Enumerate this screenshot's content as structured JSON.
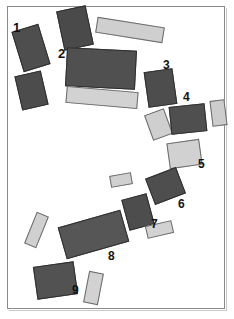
{
  "figure": {
    "title": "",
    "width": 234,
    "height": 319,
    "background": "#ffffff",
    "frame": {
      "name": "plot-border",
      "stroke": "#8a8a8a",
      "x": 7,
      "y": 6,
      "w": 218,
      "h": 303
    },
    "palette": {
      "dark": "#4b4b4b",
      "dark_alt": "#585858",
      "light": "#cccccc",
      "light_alt": "#d4d4d4",
      "outline_dark": "#2f2f2f",
      "outline_light": "#6b6b6b",
      "label_color": "#111111"
    }
  },
  "shapes": [
    {
      "id": "shape-a",
      "tone": "dark",
      "fill": "#4e4e4e",
      "x": 17,
      "y": 27,
      "w": 28,
      "h": 42,
      "rot": -17
    },
    {
      "id": "shape-b",
      "tone": "dark",
      "fill": "#4a4a4a",
      "x": 60,
      "y": 8,
      "w": 30,
      "h": 40,
      "rot": -12
    },
    {
      "id": "shape-c",
      "tone": "light",
      "fill": "#cfcfcf",
      "x": 96,
      "y": 22,
      "w": 68,
      "h": 16,
      "rot": 9
    },
    {
      "id": "shape-d",
      "tone": "dark",
      "fill": "#4c4c4c",
      "x": 18,
      "y": 73,
      "w": 27,
      "h": 35,
      "rot": -13
    },
    {
      "id": "shape-e",
      "tone": "dark",
      "fill": "#505050",
      "x": 66,
      "y": 49,
      "w": 70,
      "h": 39,
      "rot": 3
    },
    {
      "id": "shape-f",
      "tone": "light",
      "fill": "#d2d2d2",
      "x": 66,
      "y": 89,
      "w": 72,
      "h": 17,
      "rot": 5
    },
    {
      "id": "shape-g",
      "tone": "dark",
      "fill": "#4d4d4d",
      "x": 146,
      "y": 70,
      "w": 29,
      "h": 36,
      "rot": -8
    },
    {
      "id": "shape-h",
      "tone": "light",
      "fill": "#cfcfcf",
      "x": 148,
      "y": 111,
      "w": 21,
      "h": 27,
      "rot": -20
    },
    {
      "id": "shape-i",
      "tone": "dark",
      "fill": "#4f4f4f",
      "x": 170,
      "y": 105,
      "w": 36,
      "h": 28,
      "rot": -6
    },
    {
      "id": "shape-j",
      "tone": "light",
      "fill": "#cdcdcd",
      "x": 211,
      "y": 100,
      "w": 15,
      "h": 26,
      "rot": -7
    },
    {
      "id": "shape-k",
      "tone": "light",
      "fill": "#d1d1d1",
      "x": 168,
      "y": 141,
      "w": 33,
      "h": 26,
      "rot": -8
    },
    {
      "id": "shape-l",
      "tone": "light",
      "fill": "#d0d0d0",
      "x": 110,
      "y": 174,
      "w": 22,
      "h": 12,
      "rot": -10
    },
    {
      "id": "shape-m",
      "tone": "dark",
      "fill": "#4e4e4e",
      "x": 149,
      "y": 172,
      "w": 33,
      "h": 28,
      "rot": -21
    },
    {
      "id": "shape-n",
      "tone": "dark",
      "fill": "#4d4d4d",
      "x": 125,
      "y": 196,
      "w": 26,
      "h": 32,
      "rot": -15
    },
    {
      "id": "shape-o",
      "tone": "light",
      "fill": "#d2d2d2",
      "x": 146,
      "y": 223,
      "w": 27,
      "h": 13,
      "rot": -13
    },
    {
      "id": "shape-p",
      "tone": "light",
      "fill": "#d0d0d0",
      "x": 30,
      "y": 213,
      "w": 13,
      "h": 34,
      "rot": 22
    },
    {
      "id": "shape-q",
      "tone": "dark",
      "fill": "#565656",
      "x": 61,
      "y": 218,
      "w": 65,
      "h": 33,
      "rot": -16
    },
    {
      "id": "shape-r",
      "tone": "dark",
      "fill": "#525252",
      "x": 35,
      "y": 264,
      "w": 41,
      "h": 33,
      "rot": -8
    },
    {
      "id": "shape-s",
      "tone": "light",
      "fill": "#d2d2d2",
      "x": 86,
      "y": 272,
      "w": 15,
      "h": 32,
      "rot": 11
    }
  ],
  "labels": [
    {
      "id": "label-1",
      "text": "1",
      "x": 13,
      "y": 21,
      "size": 13
    },
    {
      "id": "label-2",
      "text": "2",
      "x": 58,
      "y": 47,
      "size": 13
    },
    {
      "id": "label-3",
      "text": "3",
      "x": 163,
      "y": 59,
      "size": 12
    },
    {
      "id": "label-4",
      "text": "4",
      "x": 183,
      "y": 91,
      "size": 12
    },
    {
      "id": "label-5",
      "text": "5",
      "x": 198,
      "y": 158,
      "size": 12
    },
    {
      "id": "label-6",
      "text": "6",
      "x": 178,
      "y": 198,
      "size": 12
    },
    {
      "id": "label-7",
      "text": "7",
      "x": 151,
      "y": 218,
      "size": 12
    },
    {
      "id": "label-8",
      "text": "8",
      "x": 108,
      "y": 250,
      "size": 12
    },
    {
      "id": "label-9",
      "text": "9",
      "x": 72,
      "y": 284,
      "size": 12
    }
  ]
}
